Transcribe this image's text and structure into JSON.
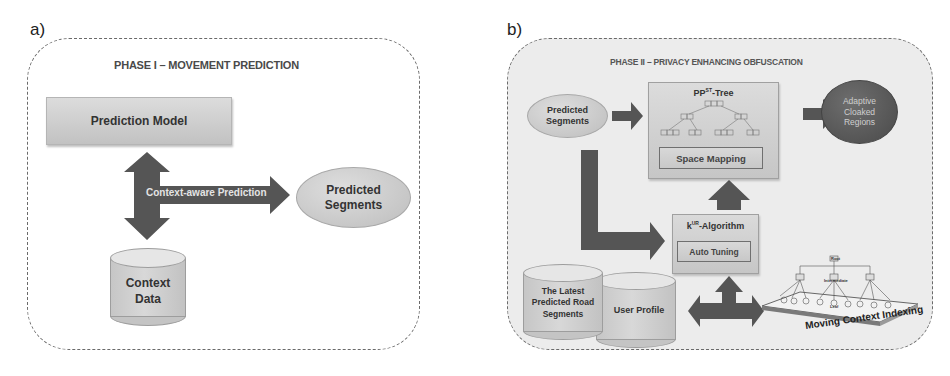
{
  "panel_a": {
    "label": "a)",
    "title": "PHASE I – MOVEMENT PREDICTION",
    "prediction_model": "Prediction Model",
    "arrow_label": "Context-aware Prediction",
    "predicted_segments": [
      "Predicted",
      "Segments"
    ],
    "context_data": [
      "Context",
      "Data"
    ]
  },
  "panel_b": {
    "label": "b)",
    "title": "PHASE II – PRIVACY ENHANCING OBFUSCATION",
    "predicted_segments": [
      "Predicted",
      "Segments"
    ],
    "tree": {
      "title_prefix": "PP",
      "title_sup": "ST",
      "title_suffix": "-Tree",
      "space_mapping": "Space Mapping"
    },
    "cloaked_regions": [
      "Adaptive",
      "Cloaked",
      "Regions"
    ],
    "algorithm": {
      "title_prefix": "k",
      "title_sup": "UR",
      "title_suffix": "-Algorithm",
      "auto_tuning": "Auto Tuning"
    },
    "latest_segments": [
      "The Latest",
      "Predicted Road",
      "Segments"
    ],
    "user_profile": "User Profile",
    "indexing": {
      "label": "Moving Context Indexing",
      "levels": [
        "Root",
        "Intermediate",
        "Leaf"
      ]
    }
  },
  "colors": {
    "arrow": "#555555",
    "box_light": "#d0d0d0",
    "ellipse_dark": "#555555",
    "panel_b_bg": "#ececec",
    "dashed_border": "#6a6a6a"
  }
}
